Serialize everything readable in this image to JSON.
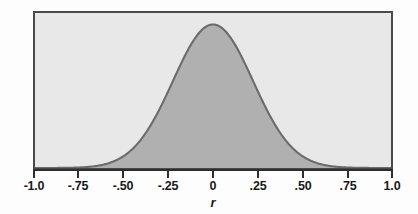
{
  "chart_data": {
    "type": "line",
    "title": "",
    "subtitle": "",
    "xlabel": "r",
    "ylabel": "",
    "grid": false,
    "legend": null,
    "distribution": "normal",
    "mean": 0,
    "sigma": 0.225,
    "peak_value": 1.0,
    "xlim": [
      -1.0,
      1.0
    ],
    "ylim": [
      0,
      1.08
    ],
    "xticks": [
      -1.0,
      -0.75,
      -0.5,
      -0.25,
      0,
      0.25,
      0.5,
      0.75,
      1.0
    ],
    "xtick_labels": [
      "-1.0",
      "-.75",
      "-.50",
      "-.25",
      "0",
      ".25",
      ".50",
      ".75",
      "1.0"
    ],
    "yticks": [],
    "ytick_labels": [],
    "x": [
      -1.0,
      -0.95,
      -0.9,
      -0.85,
      -0.8,
      -0.75,
      -0.7,
      -0.65,
      -0.6,
      -0.55,
      -0.5,
      -0.45,
      -0.4,
      -0.35,
      -0.3,
      -0.25,
      -0.2,
      -0.15,
      -0.1,
      -0.05,
      0.0,
      0.05,
      0.1,
      0.15,
      0.2,
      0.25,
      0.3,
      0.35,
      0.4,
      0.45,
      0.5,
      0.55,
      0.6,
      0.65,
      0.7,
      0.75,
      0.8,
      0.85,
      0.9,
      0.95,
      1.0
    ],
    "values": [
      0.0,
      0.0,
      0.0,
      0.001,
      0.002,
      0.004,
      0.008,
      0.016,
      0.029,
      0.051,
      0.085,
      0.135,
      0.205,
      0.295,
      0.411,
      0.537,
      0.671,
      0.801,
      0.905,
      0.976,
      1.0,
      0.976,
      0.905,
      0.801,
      0.671,
      0.537,
      0.411,
      0.295,
      0.205,
      0.135,
      0.085,
      0.051,
      0.029,
      0.016,
      0.008,
      0.004,
      0.002,
      0.001,
      0.0,
      0.0,
      0.0
    ]
  },
  "colors": {
    "page_background": "#fdfdfd",
    "plot_background": "#e8e8e8",
    "frame_border": "#4a4a4a",
    "curve_stroke": "#6b6b6b",
    "curve_fill": "#b0b0b0",
    "axis_line": "#2e2e2e",
    "tick_label": "#1a1a1a"
  },
  "axis": {
    "title": "r",
    "ticks": [
      {
        "label": "-1.0",
        "value": -1.0
      },
      {
        "label": "-.75",
        "value": -0.75
      },
      {
        "label": "-.50",
        "value": -0.5
      },
      {
        "label": "-.25",
        "value": -0.25
      },
      {
        "label": "0",
        "value": 0
      },
      {
        "label": ".25",
        "value": 0.25
      },
      {
        "label": ".50",
        "value": 0.5
      },
      {
        "label": ".75",
        "value": 0.75
      },
      {
        "label": "1.0",
        "value": 1.0
      }
    ]
  }
}
